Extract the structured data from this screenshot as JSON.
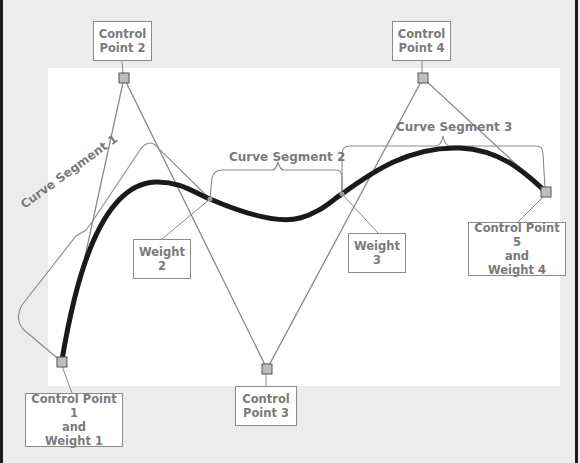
{
  "diagram": {
    "colors": {
      "background": "#ececec",
      "canvas": "#ffffff",
      "curve": "#1a1a1a",
      "control_polygon": "#8a8a8a",
      "label_text": "#7a7a7a",
      "label_border": "#8a8a8a"
    },
    "control_points": [
      {
        "id": "cp1",
        "label_lines": [
          "Control Point 1",
          "and",
          "Weight 1"
        ]
      },
      {
        "id": "cp2",
        "label_lines": [
          "Control",
          "Point 2"
        ]
      },
      {
        "id": "cp3",
        "label_lines": [
          "Control",
          "Point 3"
        ]
      },
      {
        "id": "cp4",
        "label_lines": [
          "Control",
          "Point 4"
        ]
      },
      {
        "id": "cp5",
        "label_lines": [
          "Control Point 5",
          "and",
          "Weight 4"
        ]
      }
    ],
    "weights": [
      {
        "id": "w2",
        "label_lines": [
          "Weight",
          "2"
        ]
      },
      {
        "id": "w3",
        "label_lines": [
          "Weight",
          "3"
        ]
      }
    ],
    "segments": [
      {
        "id": "seg1",
        "label": "Curve Segment 1"
      },
      {
        "id": "seg2",
        "label": "Curve Segment 2"
      },
      {
        "id": "seg3",
        "label": "Curve Segment 3"
      }
    ]
  }
}
